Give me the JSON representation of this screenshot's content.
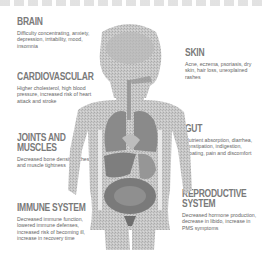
{
  "sections": {
    "brain": {
      "heading": "Brain",
      "text": "Difficulty concentrating, anxiety, depression, irritability, mood, insomnia"
    },
    "cardiovascular": {
      "heading": "Cardiovascular",
      "text": "Higher cholesterol, high blood pressure, increased risk of heart attack and stroke"
    },
    "joints": {
      "heading": "Joints and Muscles",
      "text": "Decreased bone density, aches, and muscle tightness"
    },
    "immune": {
      "heading": "Immune System",
      "text": "Decreased immune function, lowered immune defenses, increased risk of becoming ill, increase in recovery time"
    },
    "skin": {
      "heading": "Skin",
      "text": "Acne, eczema, psoriasis, dry skin, hair loss, unexplained rashes"
    },
    "gut": {
      "heading": "Gut",
      "text": "Nutrient absorption, diarrhea, constipation, indigestion, bloating, pain and discomfort"
    },
    "reproductive": {
      "heading": "Reproductive System",
      "text": "Decreased hormone production, decrease in libido, increase in PMS symptoms"
    }
  },
  "colors": {
    "heading": "#7a7a7a",
    "text": "#666666",
    "body": "#c8c8c8",
    "organ": "#8a8a8a"
  }
}
